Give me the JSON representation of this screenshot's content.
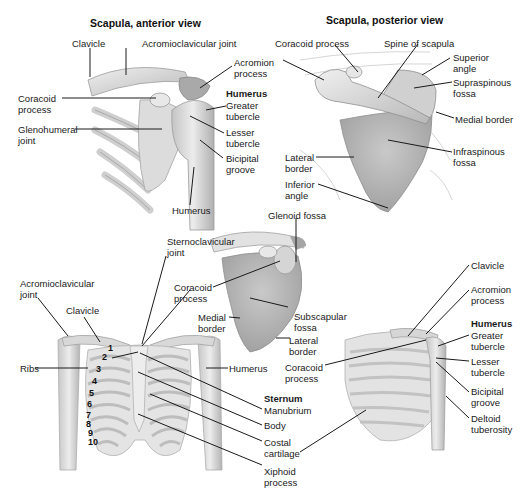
{
  "colors": {
    "bone": "#d9d9d9",
    "bone_dark": "#a8a8a8",
    "bone_light": "#eeeeee",
    "leader": "#1a1a1a",
    "text": "#1a1a1a",
    "background": "#ffffff"
  },
  "panel_anterior": {
    "title": "Scapula, anterior view",
    "labels": {
      "clavicle": "Clavicle",
      "ac_joint": "Acromioclavicular joint",
      "acromion": "Acromion\nprocess",
      "humerus_header": "Humerus",
      "greater_tubercle": "Greater\ntubercle",
      "lesser_tubercle": "Lesser\ntubercle",
      "bicipital_groove": "Bicipital\ngroove",
      "coracoid": "Coracoid\nprocess",
      "glenohumeral": "Glenohumeral\njoint",
      "humerus": "Humerus"
    }
  },
  "panel_posterior": {
    "title": "Scapula, posterior view",
    "labels": {
      "coracoid": "Coracoid process",
      "spine": "Spine of scapula",
      "acromion": "Acromion\nprocess",
      "superior_angle": "Superior\nangle",
      "supraspinous": "Supraspinous\nfossa",
      "medial_border": "Medial border",
      "infraspinous": "Infraspinous\nfossa",
      "lateral_border": "Lateral\nborder",
      "inferior_angle": "Inferior\nangle"
    }
  },
  "panel_anterior_scapula": {
    "labels": {
      "glenoid_fossa": "Glenoid fossa",
      "sternoclavicular": "Sternoclavicular\njoint",
      "coracoid": "Coracoid\nprocess",
      "medial_border": "Medial\nborder",
      "subscapular": "Subscapular\nfossa",
      "lateral_border": "Lateral\nborder"
    }
  },
  "panel_thorax_front": {
    "labels": {
      "ac_joint": "Acromioclavicular\njoint",
      "clavicle": "Clavicle",
      "ribs": "Ribs",
      "humerus": "Humerus",
      "sternum_header": "Sternum",
      "manubrium": "Manubrium",
      "body": "Body",
      "costal_cartilage": "Costal\ncartilage",
      "xiphoid": "Xiphoid\nprocess"
    },
    "rib_numbers": [
      "1",
      "2",
      "3",
      "4",
      "5",
      "6",
      "7",
      "8",
      "9",
      "10"
    ]
  },
  "panel_thorax_side": {
    "labels": {
      "clavicle": "Clavicle",
      "acromion": "Acromion\nprocess",
      "humerus_header": "Humerus",
      "greater_tubercle": "Greater\ntubercle",
      "lesser_tubercle": "Lesser\ntubercle",
      "bicipital_groove": "Bicipital\ngroove",
      "deltoid_tuberosity": "Deltoid\ntuberosity",
      "coracoid": "Coracoid\nprocess"
    }
  }
}
